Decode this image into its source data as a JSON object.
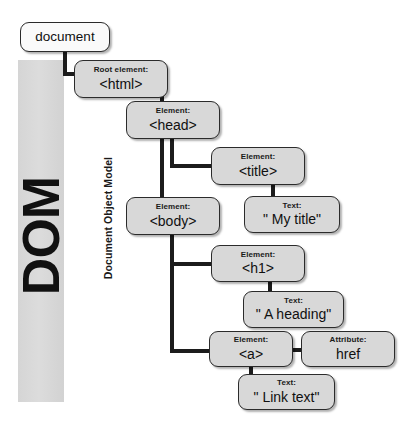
{
  "diagram": {
    "title": "DOM",
    "subtitle": "Document Object Model",
    "nodes": {
      "document": {
        "kind": "",
        "value": "document"
      },
      "html": {
        "kind": "Root element:",
        "value": "<html>"
      },
      "head": {
        "kind": "Element:",
        "value": "<head>"
      },
      "title": {
        "kind": "Element:",
        "value": "<title>"
      },
      "title_text": {
        "kind": "Text:",
        "value": "\" My title\""
      },
      "body": {
        "kind": "Element:",
        "value": "<body>"
      },
      "h1": {
        "kind": "Element:",
        "value": "<h1>"
      },
      "h1_text": {
        "kind": "Text:",
        "value": "\" A heading\""
      },
      "a": {
        "kind": "Element:",
        "value": "<a>"
      },
      "href": {
        "kind": "Attribute:",
        "value": "href"
      },
      "a_text": {
        "kind": "Text:",
        "value": "\" Link text\""
      }
    },
    "colors": {
      "node_fill": "#d8d8d8",
      "document_fill": "#fafafa",
      "node_border": "#2b2b2b",
      "connector": "#1c1c1c",
      "band_fill": "#d8d8d8",
      "text": "#101010"
    }
  }
}
